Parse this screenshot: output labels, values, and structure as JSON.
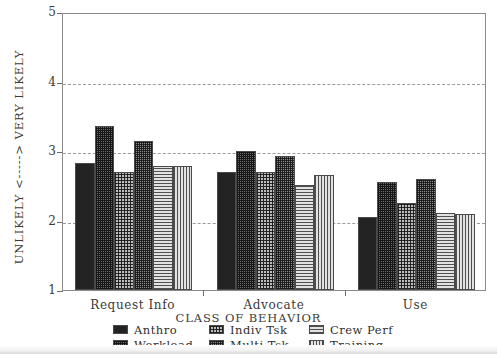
{
  "chart_data": {
    "type": "bar",
    "title": "",
    "xlabel": "CLASS OF BEHAVIOR",
    "ylabel": "UNLIKELY <-----> VERY LIKELY",
    "categories": [
      "Request Info",
      "Advocate",
      "Use"
    ],
    "ylim": [
      1,
      5
    ],
    "yticks": [
      1,
      2,
      3,
      4,
      5
    ],
    "ytick_labels": [
      "1",
      "2",
      "3",
      "4",
      "5"
    ],
    "grid": "horizontal-dashed",
    "legend_position": "below-axes",
    "series": [
      {
        "name": "Anthro",
        "pattern": "solid-dark",
        "values": [
          2.83,
          2.7,
          2.05
        ]
      },
      {
        "name": "Workload",
        "pattern": "dark-checker",
        "values": [
          3.36,
          3.0,
          2.55
        ]
      },
      {
        "name": "Indiv Tsk",
        "pattern": "light-checker",
        "values": [
          2.7,
          2.7,
          2.25
        ]
      },
      {
        "name": "Multi Tsk",
        "pattern": "mid-checker",
        "values": [
          3.14,
          2.93,
          2.6
        ]
      },
      {
        "name": "Crew Perf",
        "pattern": "horizontal-lines",
        "values": [
          2.78,
          2.51,
          2.11
        ]
      },
      {
        "name": "Training",
        "pattern": "vertical-lines",
        "values": [
          2.79,
          2.65,
          2.1
        ]
      }
    ]
  },
  "axis": {
    "y_label_text": "UNLIKELY <-----> VERY LIKELY",
    "x_label_text": "CLASS OF BEHAVIOR",
    "ytick_1": "1",
    "ytick_2": "2",
    "ytick_3": "3",
    "ytick_4": "4",
    "ytick_5": "5",
    "xcat_0": "Request Info",
    "xcat_1": "Advocate",
    "xcat_2": "Use"
  },
  "legend": {
    "items": [
      {
        "label": "Anthro"
      },
      {
        "label": "Workload"
      },
      {
        "label": "Indiv Tsk"
      },
      {
        "label": "Multi Tsk"
      },
      {
        "label": "Crew Perf"
      },
      {
        "label": "Training"
      }
    ]
  },
  "colors": {
    "frame": "#8a8a8a",
    "grid": "#9a9a9a",
    "text": "#3b3b3b",
    "bar_dark": "#232323",
    "bar_mid": "#6a6a6a",
    "bar_light": "#e2e2e2"
  }
}
